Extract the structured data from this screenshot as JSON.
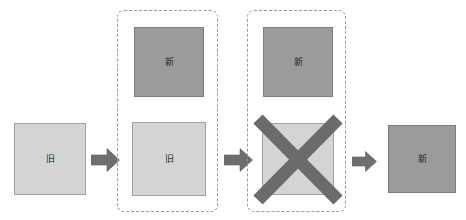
{
  "diagram": {
    "type": "process-flow",
    "colors": {
      "old_box_fill": "#d4d4d4",
      "old_box_border": "#a2a2a2",
      "new_box_fill": "#9b9b9b",
      "new_box_border": "#7d7d7d",
      "arrow_fill": "#6e6e6e",
      "cross_stroke": "#6b6b6b",
      "group_frame_border": "#9a9a9a",
      "background": "#ffffff"
    },
    "labels": {
      "old": "旧",
      "new": "新"
    },
    "stages": [
      {
        "id": "stage-1",
        "name": "initial-state",
        "grouped": false,
        "boxes": [
          {
            "id": "box-old-initial",
            "label": "旧",
            "variant": "old",
            "crossed_out": false
          }
        ]
      },
      {
        "id": "stage-2",
        "name": "both-present",
        "grouped": true,
        "boxes": [
          {
            "id": "box-new-stage2",
            "label": "新",
            "variant": "new",
            "crossed_out": false
          },
          {
            "id": "box-old-stage2",
            "label": "旧",
            "variant": "old",
            "crossed_out": false
          }
        ]
      },
      {
        "id": "stage-3",
        "name": "old-removed",
        "grouped": true,
        "boxes": [
          {
            "id": "box-new-stage3",
            "label": "新",
            "variant": "new",
            "crossed_out": false
          },
          {
            "id": "box-old-crossed",
            "label": "",
            "variant": "old",
            "crossed_out": true
          }
        ]
      },
      {
        "id": "stage-4",
        "name": "final-state",
        "grouped": false,
        "boxes": [
          {
            "id": "box-new-final",
            "label": "新",
            "variant": "new",
            "crossed_out": false
          }
        ]
      }
    ],
    "arrows": [
      {
        "id": "arrow-1",
        "direction": "right",
        "from": "stage-1",
        "to": "stage-2"
      },
      {
        "id": "arrow-2",
        "direction": "right",
        "from": "stage-2",
        "to": "stage-3"
      },
      {
        "id": "arrow-3",
        "direction": "right",
        "from": "stage-3",
        "to": "stage-4"
      }
    ]
  }
}
